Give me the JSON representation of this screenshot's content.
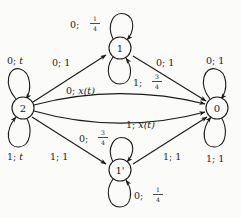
{
  "figure": {
    "type": "state-transition-diagram",
    "background_color": "#fbfbf9",
    "stroke_color": "#1a1a1a"
  },
  "nodes": [
    {
      "id": "n1",
      "label": "1",
      "cx": 120,
      "cy": 48,
      "r": 11
    },
    {
      "id": "n2",
      "label": "2",
      "cx": 23,
      "cy": 108,
      "r": 11
    },
    {
      "id": "n0",
      "label": "0",
      "cx": 217,
      "cy": 108,
      "r": 11
    },
    {
      "id": "n1p",
      "label": "1'",
      "cx": 120,
      "cy": 170,
      "r": 11
    }
  ],
  "edges": [
    {
      "id": "e_2_1",
      "from": "2",
      "to": "1",
      "label_input": "0",
      "label_weight": "1",
      "label_text": "0; 1"
    },
    {
      "id": "e_1_0",
      "from": "1",
      "to": "0",
      "label_input": "0",
      "label_weight": "1",
      "label_text": "0; 1"
    },
    {
      "id": "e_2_0_top",
      "from": "2",
      "to": "0",
      "label_input": "0",
      "label_weight": "x(t)",
      "label_text": "0; x(t)"
    },
    {
      "id": "e_2_0_bot",
      "from": "2",
      "to": "0",
      "label_input": "1",
      "label_weight": "x(t)",
      "label_text": "1; x(t)"
    },
    {
      "id": "e_2_1p",
      "from": "2",
      "to": "1'",
      "label_input": "1",
      "label_weight": "1",
      "label_text": "1; 1"
    },
    {
      "id": "e_1p_0",
      "from": "1'",
      "to": "0",
      "label_input": "1",
      "label_weight": "1",
      "label_text": "1; 1"
    }
  ],
  "self_loops": [
    {
      "id": "l_2_top",
      "node": "2",
      "position": "top",
      "label_input": "0",
      "label_weight": "t",
      "label_text": "0; t"
    },
    {
      "id": "l_2_bot",
      "node": "2",
      "position": "bottom",
      "label_input": "1",
      "label_weight": "t",
      "label_text": "1; t"
    },
    {
      "id": "l_1_top",
      "node": "1",
      "position": "top",
      "label_input": "0",
      "label_weight": "1/4",
      "label_text": "0; 1/4"
    },
    {
      "id": "l_1_bot",
      "node": "1",
      "position": "bottom",
      "label_input": "1",
      "label_weight": "3/4",
      "label_text": "1; 3/4"
    },
    {
      "id": "l_1p_top",
      "node": "1'",
      "position": "top",
      "label_input": "0",
      "label_weight": "3/4",
      "label_text": "0; 3/4"
    },
    {
      "id": "l_1p_bot",
      "node": "1'",
      "position": "bottom",
      "label_input": "0",
      "label_weight": "1/4",
      "label_text": "0; 1/4"
    },
    {
      "id": "l_0_top",
      "node": "0",
      "position": "top",
      "label_input": "0",
      "label_weight": "1",
      "label_text": "0; 1"
    },
    {
      "id": "l_0_bot",
      "node": "0",
      "position": "bottom",
      "label_input": "1",
      "label_weight": "1",
      "label_text": "1; 1"
    }
  ],
  "labels": {
    "loop1_top": {
      "input": "0",
      "sep": ";",
      "num": "1",
      "den": "4"
    },
    "loop1_bottom": {
      "input": "1",
      "sep": ";",
      "num": "3",
      "den": "4"
    },
    "loop2_top": {
      "input": "0",
      "sep": ";",
      "weight": "t"
    },
    "loop2_bottom": {
      "input": "1",
      "sep": ";",
      "weight": "t"
    },
    "loop0_top": {
      "input": "0",
      "sep": ";",
      "weight": "1"
    },
    "loop0_bottom": {
      "input": "1",
      "sep": ";",
      "weight": "1"
    },
    "loop1p_top": {
      "input": "0",
      "sep": ";",
      "num": "3",
      "den": "4"
    },
    "loop1p_bottom": {
      "input": "0",
      "sep": ";",
      "num": "1",
      "den": "4"
    },
    "edge_2_1": {
      "input": "0",
      "sep": ";",
      "weight": "1"
    },
    "edge_1_0": {
      "input": "0",
      "sep": ";",
      "weight": "1"
    },
    "edge_2_0_top": {
      "input": "0",
      "sep": ";",
      "weight": "x(t)"
    },
    "edge_2_0_bot": {
      "input": "1",
      "sep": ";",
      "weight": "x(t)"
    },
    "edge_2_1p": {
      "input": "1",
      "sep": ";",
      "weight": "1"
    },
    "edge_1p_0": {
      "input": "1",
      "sep": ";",
      "weight": "1"
    }
  },
  "node_text": {
    "one": "1",
    "two": "2",
    "zero": "0",
    "one_prime": "1'"
  }
}
